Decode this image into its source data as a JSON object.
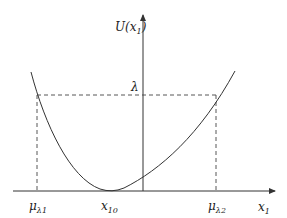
{
  "diagram": {
    "type": "potential-curve",
    "y_axis_label": {
      "main": "U(x",
      "sub": "1",
      "close": ")"
    },
    "x_axis_label": {
      "main": "x",
      "sub": "1"
    },
    "level_label": "λ",
    "x_ticks": [
      {
        "main": "μ",
        "sub": "λ1"
      },
      {
        "main": "x",
        "sub": "10"
      },
      {
        "main": "μ",
        "sub": "λ2"
      }
    ],
    "colors": {
      "curve": "#333333",
      "axis": "#333333",
      "dashed": "#444444"
    }
  }
}
